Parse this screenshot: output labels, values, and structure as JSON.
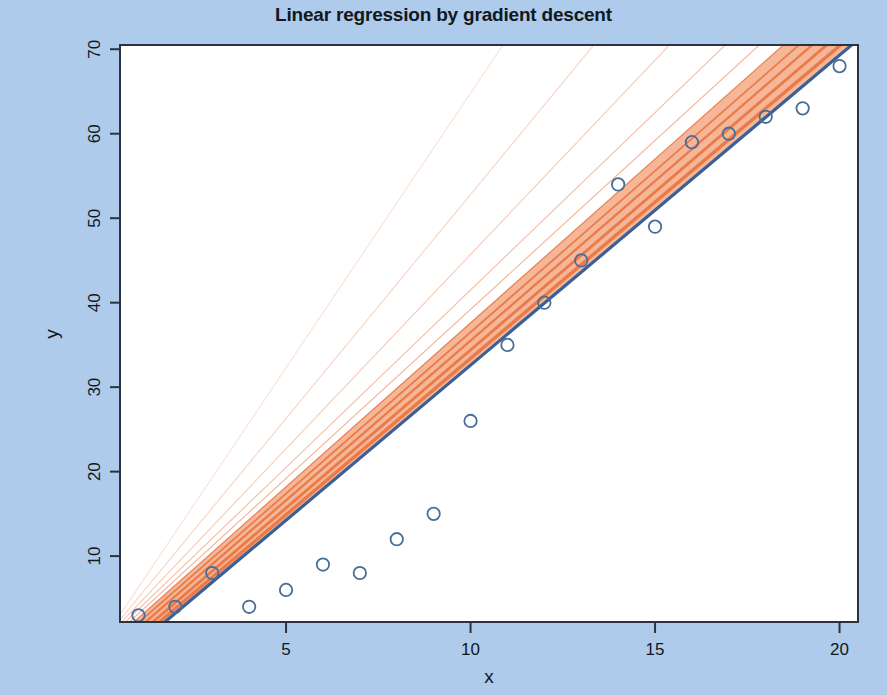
{
  "chart_data": {
    "type": "scatter",
    "title": "Linear regression by gradient descent",
    "xlabel": "x",
    "ylabel": "y",
    "xlim": [
      0.5,
      20.5
    ],
    "ylim": [
      2.2,
      70.5
    ],
    "xticks": [
      5,
      10,
      15,
      20
    ],
    "yticks": [
      10,
      20,
      30,
      40,
      50,
      60,
      70
    ],
    "grid": false,
    "legend": null,
    "x": [
      1,
      2,
      3,
      4,
      5,
      6,
      7,
      8,
      9,
      10,
      11,
      12,
      13,
      14,
      15,
      16,
      17,
      18,
      19,
      20
    ],
    "y": [
      3,
      4,
      8,
      4,
      6,
      9,
      8,
      12,
      15,
      26,
      35,
      40,
      45,
      54,
      49,
      59,
      60,
      62,
      63,
      68
    ],
    "series": [
      {
        "name": "observations",
        "type": "scatter",
        "marker": "open-circle",
        "color": "#4a6d96",
        "x": [
          1,
          2,
          3,
          4,
          5,
          6,
          7,
          8,
          9,
          10,
          11,
          12,
          13,
          14,
          15,
          16,
          17,
          18,
          19,
          20
        ],
        "values": [
          3,
          4,
          8,
          4,
          6,
          9,
          8,
          12,
          15,
          26,
          35,
          40,
          45,
          54,
          49,
          59,
          60,
          62,
          63,
          68
        ]
      },
      {
        "name": "final fit",
        "type": "line",
        "color": "#3c5f96",
        "intercept": -4.1,
        "slope": 3.67
      },
      {
        "name": "gradient descent iterations",
        "type": "line",
        "color": "#e8703a",
        "iterations": [
          {
            "intercept": -0.2,
            "slope": 6.5
          },
          {
            "intercept": -0.2,
            "slope": 5.3
          },
          {
            "intercept": -0.3,
            "slope": 4.6
          },
          {
            "intercept": -0.5,
            "slope": 4.2
          },
          {
            "intercept": -0.8,
            "slope": 4.0
          },
          {
            "intercept": -1.2,
            "slope": 3.88
          },
          {
            "intercept": -1.7,
            "slope": 3.82
          },
          {
            "intercept": -2.3,
            "slope": 3.78
          },
          {
            "intercept": -3.0,
            "slope": 3.74
          },
          {
            "intercept": -3.6,
            "slope": 3.7
          }
        ]
      }
    ]
  },
  "axes": {
    "y_tick_labels": [
      "10",
      "20",
      "30",
      "40",
      "50",
      "60",
      "70"
    ],
    "x_tick_labels": [
      "5",
      "10",
      "15",
      "20"
    ],
    "x_axis_label": "x",
    "y_axis_label": "y"
  },
  "colors": {
    "background": "#aecbeb",
    "panel": "#ffffff",
    "axis": "#2b3340",
    "point": "#4a6d96",
    "fit_line": "#3c5f96",
    "iteration_line": "#e8703a",
    "band_fill": "#f5b393",
    "title_text": "#111820"
  }
}
